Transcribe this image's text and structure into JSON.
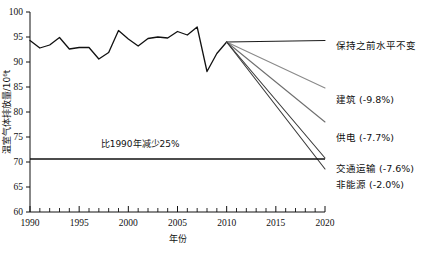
{
  "chart_data": {
    "type": "line",
    "title": "",
    "xlabel": "年份",
    "ylabel": "温室气体排放量/10⁶t",
    "xlim": [
      1990,
      2020
    ],
    "ylim": [
      60,
      100
    ],
    "grid": false,
    "legend_position": "right",
    "x_ticks_major": [
      "1990",
      "1995",
      "2000",
      "2005",
      "2010",
      "2015",
      "2020"
    ],
    "x_ticks_major_values": [
      1990,
      1995,
      2000,
      2005,
      2010,
      2015,
      2020
    ],
    "x_ticks_minor_values": [
      1991,
      1992,
      1993,
      1994,
      1996,
      1997,
      1998,
      1999,
      2001,
      2002,
      2003,
      2004,
      2006,
      2007,
      2008,
      2009,
      2011,
      2012,
      2013,
      2014,
      2016,
      2017,
      2018,
      2019
    ],
    "y_ticks": [
      "60",
      "65",
      "70",
      "75",
      "80",
      "85",
      "90",
      "95",
      "100"
    ],
    "y_ticks_values": [
      60,
      65,
      70,
      75,
      80,
      85,
      90,
      95,
      100
    ],
    "annotations": [
      {
        "text": "比1990年减少25%",
        "x": 2001.2,
        "y": 73.0
      }
    ],
    "target_line": {
      "name": "1990年基准减少25%目标线",
      "value": 70.6,
      "x_start": 1990,
      "x_end": 2020,
      "color": "#111111"
    },
    "series": [
      {
        "name": "历史排放量",
        "kind": "historical",
        "color": "#111111",
        "x": [
          1990,
          1991,
          1992,
          1993,
          1994,
          1995,
          1996,
          1997,
          1998,
          1999,
          2000,
          2001,
          2002,
          2003,
          2004,
          2005,
          2006,
          2007,
          2008,
          2009,
          2010
        ],
        "values": [
          94.3,
          92.8,
          93.4,
          94.9,
          92.6,
          92.9,
          92.9,
          90.6,
          91.9,
          96.3,
          94.6,
          93.2,
          94.7,
          95.0,
          94.8,
          96.1,
          95.4,
          97.0,
          88.1,
          91.7,
          94.0
        ]
      },
      {
        "name": "保持之前水平不变",
        "kind": "projection",
        "color": "#1c1c1c",
        "label": "保持之前水平不变",
        "change_pct": null,
        "x": [
          2010,
          2020
        ],
        "values": [
          94.0,
          94.3
        ]
      },
      {
        "name": "建筑",
        "kind": "projection",
        "color": "#8a8a8a",
        "label": "建筑 (-9.8%)",
        "change_pct": -9.8,
        "x": [
          2010,
          2020
        ],
        "values": [
          94.0,
          84.8
        ]
      },
      {
        "name": "供电",
        "kind": "projection",
        "color": "#6f6f6f",
        "label": "供电 (-7.7%)",
        "change_pct": -7.7,
        "x": [
          2010,
          2020
        ],
        "values": [
          94.0,
          78.0
        ]
      },
      {
        "name": "交通运输",
        "kind": "projection",
        "color": "#3a3a3a",
        "label": "交通运输 (-7.6%)",
        "change_pct": -7.6,
        "x": [
          2010,
          2020
        ],
        "values": [
          94.0,
          70.8
        ]
      },
      {
        "name": "非能源",
        "kind": "projection",
        "color": "#3a3a3a",
        "label": "非能源 (-2.0%)",
        "change_pct": -2.0,
        "x": [
          2010,
          2020
        ],
        "values": [
          94.0,
          68.6
        ]
      }
    ],
    "legend_entries": [
      {
        "label": "保持之前水平不变",
        "color": "#1c1c1c",
        "y": 49
      },
      {
        "label": "建筑 (-9.8%)",
        "color": "#8a8a8a",
        "y": 103
      },
      {
        "label": "供电 (-7.7%)",
        "color": "#6f6f6f",
        "y": 141
      },
      {
        "label": "交通运输 (-7.6%)",
        "color": "#3a3a3a",
        "y": 172
      },
      {
        "label": "非能源 (-2.0%)",
        "color": "#3a3a3a",
        "y": 188
      }
    ]
  }
}
